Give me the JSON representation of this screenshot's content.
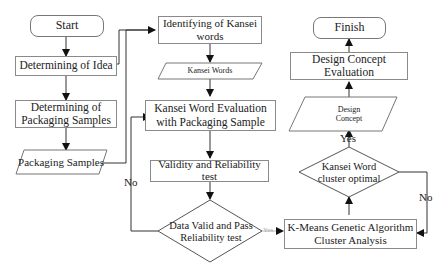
{
  "diagram": {
    "type": "flowchart",
    "nodes": {
      "start": "Start",
      "idea": "Determining of Idea",
      "samples_l1": "Determining of",
      "samples_l2": "Packaging Samples",
      "packaging_samples": "Packaging Samples",
      "identify_l1": "Identifying of Kansei",
      "identify_l2": "words",
      "kansei_words": "Kansei Words",
      "evaluation_l1": "Kansei Word Evaluation",
      "evaluation_l2": "with Packaging Sample",
      "validity_l1": "Validity and Reliability",
      "validity_l2": "test",
      "decision_valid_l1": "Data Valid and Pass",
      "decision_valid_l2": "Reliability test",
      "kmeans_l1": "K-Means Genetic Algorithm",
      "kmeans_l2": "Cluster Analysis",
      "decision_cluster_l1": "Kansei Word",
      "decision_cluster_l2": "cluster optimal",
      "design_concept_l1": "Design",
      "design_concept_l2": "Concept",
      "evaluation_concept_l1": "Design Concept",
      "evaluation_concept_l2": "Evaluation",
      "finish": "Finish"
    },
    "edge_labels": {
      "no_valid": "No",
      "yes_valid": "Yes",
      "yes_cluster": "Yes",
      "no_cluster": "No"
    }
  }
}
